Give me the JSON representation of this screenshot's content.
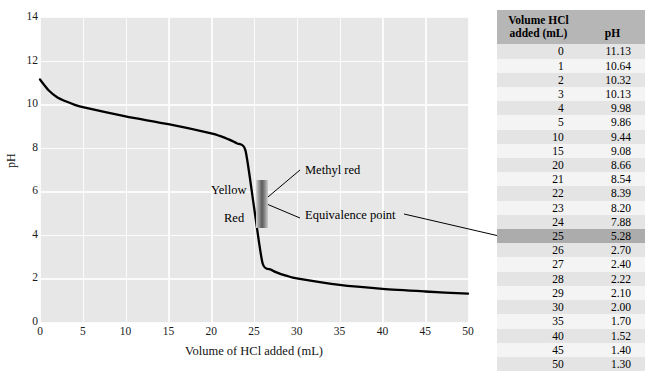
{
  "chart_data": {
    "type": "line",
    "title": "",
    "xlabel": "Volume of HCl added (mL)",
    "ylabel": "pH",
    "xlim": [
      0,
      50
    ],
    "ylim": [
      0,
      14
    ],
    "xticks": [
      0,
      5,
      10,
      15,
      20,
      25,
      30,
      35,
      40,
      45,
      50
    ],
    "yticks": [
      0,
      2,
      4,
      6,
      8,
      10,
      12,
      14
    ],
    "grid": true,
    "legend": "none",
    "series": [
      {
        "name": "Titration of weak base with HCl",
        "x": [
          0,
          1,
          2,
          3,
          4,
          5,
          10,
          15,
          20,
          21,
          22,
          23,
          24,
          25,
          26,
          27,
          28,
          29,
          30,
          35,
          40,
          45,
          50
        ],
        "y": [
          11.13,
          10.64,
          10.32,
          10.13,
          9.98,
          9.86,
          9.44,
          9.08,
          8.66,
          8.54,
          8.39,
          8.2,
          7.88,
          5.28,
          2.7,
          2.4,
          2.22,
          2.1,
          2.0,
          1.7,
          1.52,
          1.4,
          1.3
        ]
      }
    ],
    "annotations": [
      {
        "name": "methyl-red",
        "text": "Methyl red",
        "x": 25,
        "y": 7.0
      },
      {
        "name": "equivalence-point",
        "text": "Equivalence point",
        "x": 25,
        "y": 5.28
      },
      {
        "name": "yellow",
        "text": "Yellow",
        "x": 23.5,
        "y": 6.2
      },
      {
        "name": "red",
        "text": "Red",
        "x": 23.5,
        "y": 4.9
      }
    ],
    "indicator_band": {
      "name": "methyl-red-range",
      "ph_low": 4.4,
      "ph_high": 6.2,
      "upper_color_label": "Yellow",
      "lower_color_label": "Red"
    }
  },
  "axes": {
    "y_title": "pH",
    "x_title": "Volume of HCl added (mL)",
    "y_tick_labels": [
      "14",
      "12",
      "10",
      "8",
      "6",
      "4",
      "2",
      "0"
    ],
    "x_tick_labels": [
      "0",
      "5",
      "10",
      "15",
      "20",
      "25",
      "30",
      "35",
      "40",
      "45",
      "50"
    ]
  },
  "annotations": {
    "methyl_red": "Methyl red",
    "equivalence_point": "Equivalence point",
    "yellow": "Yellow",
    "red": "Red"
  },
  "table": {
    "headers": {
      "volume": "Volume HCl added (mL)",
      "volume_line1": "Volume HCl",
      "volume_line2": "added (mL)",
      "ph": "pH"
    },
    "rows": [
      {
        "volume": "0",
        "ph": "11.13",
        "highlight": false
      },
      {
        "volume": "1",
        "ph": "10.64",
        "highlight": false
      },
      {
        "volume": "2",
        "ph": "10.32",
        "highlight": false
      },
      {
        "volume": "3",
        "ph": "10.13",
        "highlight": false
      },
      {
        "volume": "4",
        "ph": "9.98",
        "highlight": false
      },
      {
        "volume": "5",
        "ph": "9.86",
        "highlight": false
      },
      {
        "volume": "10",
        "ph": "9.44",
        "highlight": false
      },
      {
        "volume": "15",
        "ph": "9.08",
        "highlight": false
      },
      {
        "volume": "20",
        "ph": "8.66",
        "highlight": false
      },
      {
        "volume": "21",
        "ph": "8.54",
        "highlight": false
      },
      {
        "volume": "22",
        "ph": "8.39",
        "highlight": false
      },
      {
        "volume": "23",
        "ph": "8.20",
        "highlight": false
      },
      {
        "volume": "24",
        "ph": "7.88",
        "highlight": false
      },
      {
        "volume": "25",
        "ph": "5.28",
        "highlight": true
      },
      {
        "volume": "26",
        "ph": "2.70",
        "highlight": false
      },
      {
        "volume": "27",
        "ph": "2.40",
        "highlight": false
      },
      {
        "volume": "28",
        "ph": "2.22",
        "highlight": false
      },
      {
        "volume": "29",
        "ph": "2.10",
        "highlight": false
      },
      {
        "volume": "30",
        "ph": "2.00",
        "highlight": false
      },
      {
        "volume": "35",
        "ph": "1.70",
        "highlight": false
      },
      {
        "volume": "40",
        "ph": "1.52",
        "highlight": false
      },
      {
        "volume": "45",
        "ph": "1.40",
        "highlight": false
      },
      {
        "volume": "50",
        "ph": "1.30",
        "highlight": false
      }
    ]
  },
  "colors": {
    "plot_background": "#e7e7e7",
    "gridline": "#fbfbfb",
    "curve": "#000000",
    "table_header_bg": "#b6b6b6",
    "table_row_odd": "#e4e4e4",
    "table_row_even": "#f4f4f4",
    "table_row_highlight": "#acacac",
    "indicator_band": "#5b5b5b"
  }
}
